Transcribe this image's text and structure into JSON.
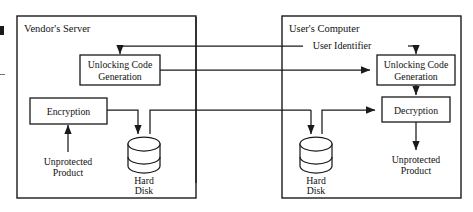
{
  "diagram": {
    "title_vendor": "Vendor's Server",
    "title_user": "User's Computer",
    "panels": [
      {
        "id": "vendor",
        "label": "Vendor's Server"
      },
      {
        "id": "user",
        "label": "User's Computer"
      }
    ],
    "boxes": [
      {
        "id": "ucg-left",
        "line1": "Unlocking Code",
        "line2": "Generation"
      },
      {
        "id": "encryption",
        "line1": "Encryption",
        "line2": ""
      },
      {
        "id": "ucg-right",
        "line1": "Unlocking Code",
        "line2": "Generation"
      },
      {
        "id": "decryption",
        "line1": "Decryption",
        "line2": ""
      }
    ],
    "stores": [
      {
        "id": "hard-disk-left",
        "line1": "Hard",
        "line2": "Disk"
      },
      {
        "id": "hard-disk-right",
        "line1": "Hard",
        "line2": "Disk"
      }
    ],
    "flows": [
      {
        "id": "unprotected-product-in",
        "line1": "Unprotected",
        "line2": "Product"
      },
      {
        "id": "unprotected-product-out",
        "line1": "Unprotected",
        "line2": "Product"
      }
    ],
    "edge_labels": [
      {
        "id": "user-identifier",
        "text": "User Identifier"
      }
    ],
    "colors": {
      "stroke": "#1a1a1a",
      "text": "#111111",
      "background": "#ffffff"
    }
  }
}
